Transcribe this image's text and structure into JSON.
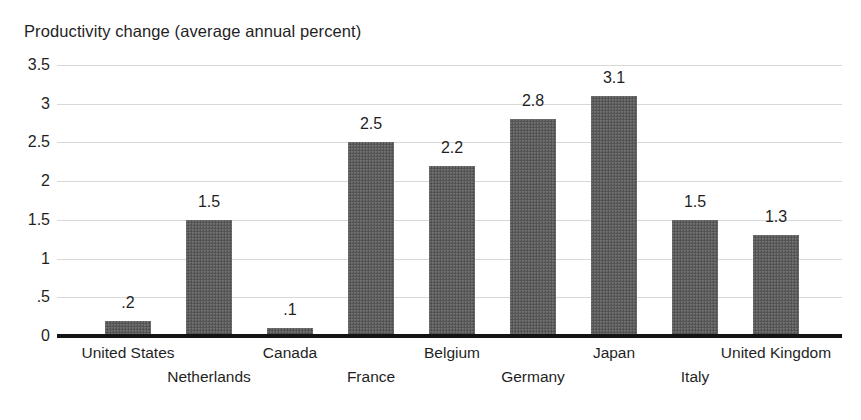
{
  "chart_data": {
    "type": "bar",
    "title": "Productivity change (average annual percent)",
    "xlabel": "",
    "ylabel": "",
    "ylim": [
      0,
      3.5
    ],
    "grid": true,
    "legend": "none",
    "categories": [
      "United States",
      "Netherlands",
      "Canada",
      "France",
      "Belgium",
      "Germany",
      "Japan",
      "Italy",
      "United Kingdom"
    ],
    "values": [
      0.2,
      1.5,
      0.1,
      2.5,
      2.2,
      2.8,
      3.1,
      1.5,
      1.3
    ],
    "value_labels": [
      ".2",
      "1.5",
      ".1",
      "2.5",
      "2.2",
      "2.8",
      "3.1",
      "1.5",
      "1.3"
    ],
    "ytick_values": [
      3.5,
      3,
      2.5,
      2,
      1.5,
      1,
      0.5,
      0
    ],
    "ytick_labels": [
      "3.5",
      "3",
      "2.5",
      "2",
      "1.5",
      "1",
      ".5",
      "0"
    ],
    "bar_color": "#5c5c5c",
    "gridline_color": "#d8d8d8",
    "axis_color": "#141414",
    "text_color": "#1f1f1f",
    "background_color": "#ffffff"
  }
}
